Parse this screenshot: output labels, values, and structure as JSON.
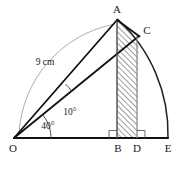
{
  "figure": {
    "canvas": {
      "width": 189,
      "height": 170,
      "background": "#ffffff"
    },
    "colors": {
      "stroke_heavy": "#111111",
      "stroke_arc": "#222222",
      "stroke_thin": "#8a8a8a",
      "hatch": "#4d4d4d",
      "label": "#1a1a1a"
    },
    "vertices": [
      {
        "id": "O",
        "label": "O",
        "x": 14,
        "y": 138,
        "label_x": 13,
        "label_y": 149
      },
      {
        "id": "A",
        "label": "A",
        "x": 117,
        "y": 20,
        "label_x": 117,
        "label_y": 10
      },
      {
        "id": "C",
        "label": "C",
        "x": 139,
        "y": 36,
        "label_x": 147,
        "label_y": 31
      },
      {
        "id": "B",
        "label": "B",
        "x": 117,
        "y": 138,
        "label_x": 118,
        "label_y": 149
      },
      {
        "id": "D",
        "label": "D",
        "x": 137,
        "y": 138,
        "label_x": 137,
        "label_y": 149
      },
      {
        "id": "E",
        "label": "E",
        "x": 168,
        "y": 138,
        "label_x": 168,
        "label_y": 149
      }
    ],
    "angles": [
      {
        "id": "angle-40",
        "label": "40°",
        "value": 40,
        "unit": "degrees",
        "label_x": 48,
        "label_y": 127,
        "at": "O",
        "between": [
          "OC",
          "OE"
        ]
      },
      {
        "id": "angle-10",
        "label": "10°",
        "value": 10,
        "unit": "degrees",
        "label_x": 70,
        "label_y": 113,
        "at": "O",
        "between": [
          "OA",
          "OC"
        ]
      }
    ],
    "dimensions": [
      {
        "id": "radius-9cm",
        "label": "9 cm",
        "value": 9,
        "unit": "cm",
        "label_x": 45,
        "label_y": 63,
        "measures": "OA"
      }
    ],
    "right_angle_marks": [
      {
        "id": "right-angle-B",
        "at": "B"
      },
      {
        "id": "right-angle-D",
        "at": "D"
      }
    ],
    "hatched_region": {
      "id": "region-ABDC",
      "description": "Region bounded by A, B, D, C",
      "corners": [
        "A",
        "B",
        "D",
        "C"
      ]
    },
    "arcs": [
      {
        "id": "arc-A-to-E",
        "from": "A",
        "through": "C",
        "to": "E",
        "center": "O",
        "radius_px": 155
      },
      {
        "id": "arc-dimension-9cm",
        "from": "O-baseline",
        "to": "A",
        "style": "thin"
      }
    ],
    "segments": [
      {
        "id": "segment-OE",
        "from": "O",
        "to": "E"
      },
      {
        "id": "segment-OA",
        "from": "O",
        "to": "A"
      },
      {
        "id": "segment-OC",
        "from": "O",
        "to": "C"
      },
      {
        "id": "segment-AB",
        "from": "A",
        "to": "B"
      },
      {
        "id": "segment-AC",
        "from": "A",
        "to": "C"
      },
      {
        "id": "segment-CD",
        "from": "C",
        "to": "D"
      }
    ]
  }
}
